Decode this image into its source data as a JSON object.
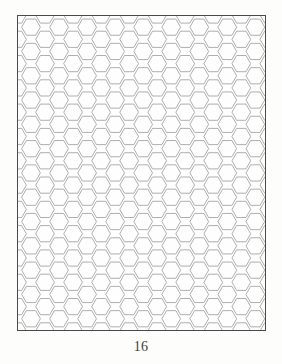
{
  "page": {
    "number_label": "16",
    "background_color": "#fdfdfc"
  },
  "figure": {
    "name": "hexagonal-grid",
    "description_label": "",
    "frame": {
      "x": 17,
      "y": 15,
      "width": 249,
      "height": 316,
      "border_color": "#4a4a4a",
      "border_width": 1.4,
      "fill_color": "#fefefe"
    },
    "grid": {
      "orientation": "flat-top",
      "line_color": "#8d8d8d",
      "line_width": 0.7,
      "circumradius": 9.35,
      "column_pitch": 14.02,
      "row_pitch": 24.3,
      "columns": 19,
      "rows": 15
    }
  },
  "chart_data": {
    "type": "diagram",
    "title": "",
    "xlabel": "",
    "ylabel": "",
    "pattern": "hexagonal-tessellation",
    "cell_shape": "hexagon",
    "cell_orientation": "flat-top",
    "approx_columns": 10,
    "approx_rows": 13
  }
}
